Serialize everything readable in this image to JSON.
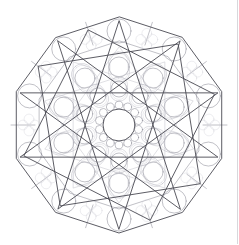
{
  "artwork": {
    "title": "Geometric Decagonal Mandala",
    "type": "line-art-coloring-page",
    "symmetry_order": 10,
    "center": {
      "x": 119,
      "y": 125
    },
    "background_color": "#ffffff",
    "stroke_colors": {
      "heavy": "#4a4a52",
      "medium": "#8e8e98",
      "light": "#b9b9c2",
      "faint": "#d2d2d8",
      "edge_rule": "#d8d8dc"
    },
    "stroke_widths": {
      "heavy": 0.9,
      "medium": 0.55,
      "light": 0.45,
      "faint": 0.4
    },
    "layers": [
      {
        "name": "outer-decagon-border",
        "shape": "decagon",
        "sides": 10,
        "radius": 108,
        "rotation_deg": 90,
        "stroke": "heavy"
      },
      {
        "name": "inner-decagon-ring",
        "shape": "decagon",
        "sides": 10,
        "radius": 84,
        "rotation_deg": 90,
        "stroke": "medium"
      },
      {
        "name": "overlapping-square-a",
        "shape": "square",
        "radius": 100,
        "rotation_deg": 18,
        "stroke": "heavy"
      },
      {
        "name": "overlapping-square-b",
        "shape": "square",
        "radius": 100,
        "rotation_deg": 54,
        "stroke": "heavy"
      },
      {
        "name": "star-pentagram-a",
        "shape": "star-polygon",
        "points": 5,
        "step": 2,
        "radius": 104,
        "rotation_deg": 90,
        "stroke": "heavy"
      },
      {
        "name": "star-pentagram-b",
        "shape": "star-polygon",
        "points": 5,
        "step": 2,
        "radius": 104,
        "rotation_deg": 270,
        "stroke": "heavy"
      },
      {
        "name": "ten-point-star",
        "shape": "star-polygon",
        "points": 10,
        "step": 3,
        "radius": 78,
        "rotation_deg": 90,
        "stroke": "light"
      },
      {
        "name": "outer-cell-circles",
        "count": 10,
        "orbit_radius": 94,
        "circle_radius": 12,
        "stroke": "medium"
      },
      {
        "name": "outer-quatrefoils",
        "count": 10,
        "orbit_radius": 90,
        "lobe_radius": 6,
        "stroke": "faint"
      },
      {
        "name": "mid-petal-ring",
        "count": 10,
        "orbit_radius": 58,
        "petal_length": 30,
        "petal_width": 21,
        "stroke": "light"
      },
      {
        "name": "mid-petal-circles",
        "count": 10,
        "orbit_radius": 58,
        "circle_radius": 10,
        "stroke": "medium"
      },
      {
        "name": "inner-petal-ring",
        "count": 10,
        "orbit_radius": 36,
        "petal_length": 24,
        "petal_width": 17,
        "stroke": "light"
      },
      {
        "name": "inner-petal-circles",
        "count": 10,
        "orbit_radius": 36,
        "circle_radius": 8,
        "stroke": "medium"
      },
      {
        "name": "center-scallop-ring",
        "count": 14,
        "orbit_radius": 20,
        "bump_radius": 4,
        "stroke": "medium"
      },
      {
        "name": "center-circle",
        "radius": 16,
        "stroke": "heavy"
      }
    ]
  },
  "chrome": {
    "right_edge_rule_visible": true
  }
}
